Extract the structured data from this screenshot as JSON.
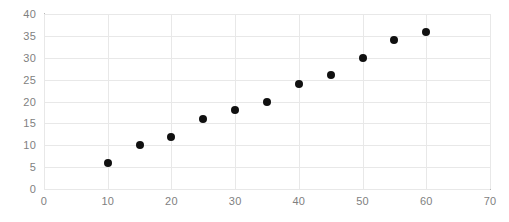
{
  "chart_data": {
    "type": "scatter",
    "title": "",
    "subtitle": "",
    "xlabel": "",
    "ylabel": "",
    "xlim": [
      0,
      70
    ],
    "ylim": [
      0,
      40
    ],
    "xticks": [
      0,
      10,
      20,
      30,
      40,
      50,
      60,
      70
    ],
    "yticks": [
      0,
      5,
      10,
      15,
      20,
      25,
      30,
      35,
      40
    ],
    "grid": true,
    "legend": null,
    "legend_position": "none",
    "marker_color": "#101010",
    "gridline_color": "#e8e8e8",
    "axis_line_color": "#b8b8b8",
    "tick_label_color": "#7f7f7f",
    "series": [
      {
        "name": "",
        "x": [
          10,
          15,
          20,
          25,
          30,
          35,
          40,
          45,
          50,
          55,
          60
        ],
        "y": [
          6,
          10,
          12,
          16,
          18,
          20,
          24,
          26,
          30,
          34,
          36
        ]
      }
    ],
    "points": [
      {
        "x": 10,
        "y": 6
      },
      {
        "x": 15,
        "y": 10
      },
      {
        "x": 20,
        "y": 12
      },
      {
        "x": 25,
        "y": 16
      },
      {
        "x": 30,
        "y": 18
      },
      {
        "x": 35,
        "y": 20
      },
      {
        "x": 40,
        "y": 24
      },
      {
        "x": 45,
        "y": 26
      },
      {
        "x": 50,
        "y": 30
      },
      {
        "x": 55,
        "y": 34
      },
      {
        "x": 60,
        "y": 36
      }
    ]
  }
}
